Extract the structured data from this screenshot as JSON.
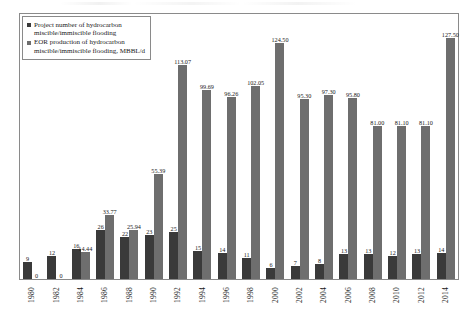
{
  "legend": {
    "entries": [
      {
        "label": "Project number of hydrocarbon\nmiscible/immiscible flooding",
        "color": "#3a3a3a",
        "swatch_name": "legend-swatch-project-number"
      },
      {
        "label": "EOR production of hydrocarbon\nmiscible/immiscible flooding, MBBL/d",
        "color": "#6e6e6e",
        "swatch_name": "legend-swatch-eor-production"
      }
    ]
  },
  "chart_data": {
    "type": "bar",
    "title": "",
    "subtitle": "",
    "xlabel": "",
    "ylabel": "",
    "grid": false,
    "legend_position": "top-left",
    "ylim": [
      0,
      140
    ],
    "categories": [
      "1980",
      "1982",
      "1984",
      "1986",
      "1988",
      "1990",
      "1992",
      "1994",
      "1996",
      "1998",
      "2000",
      "2002",
      "2004",
      "2006",
      "2008",
      "2010",
      "2012",
      "2014"
    ],
    "series": [
      {
        "name": "Project number of hydrocarbon miscible/immiscible flooding",
        "color": "#3a3a3a",
        "values": [
          9,
          12,
          16,
          26,
          22,
          23,
          25,
          15,
          14,
          11,
          6,
          7,
          8,
          13,
          13,
          12,
          13,
          14
        ],
        "labels": [
          "9",
          "12",
          "16",
          "26",
          "22",
          "23",
          "25",
          "15",
          "14",
          "11",
          "6",
          "7",
          "8",
          "13",
          "13",
          "12",
          "13",
          "14"
        ]
      },
      {
        "name": "EOR production of hydrocarbon miscible/immiscible flooding, MBBL/d",
        "color": "#6e6e6e",
        "values": [
          0,
          0,
          14.44,
          33.77,
          25.94,
          55.39,
          113.07,
          99.69,
          96.26,
          102.05,
          124.5,
          95.3,
          97.3,
          95.8,
          81.0,
          81.1,
          81.1,
          127.5
        ],
        "labels": [
          "0",
          "0",
          "14.44",
          "33.77",
          "25.94",
          "55.39",
          "113.07",
          "99.69",
          "96.26",
          "102.05",
          "124.50",
          "95.30",
          "97.30",
          "95.80",
          "81.00",
          "81.10",
          "81.10",
          "127.50"
        ]
      }
    ]
  }
}
